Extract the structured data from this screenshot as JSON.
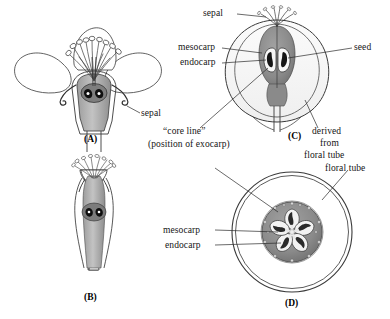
{
  "figure": {
    "panels": [
      {
        "id": "A",
        "label": "(A)",
        "caption": "longitudinal section of flower"
      },
      {
        "id": "B",
        "label": "(B)",
        "caption": "longitudinal section of young fruit"
      },
      {
        "id": "C",
        "label": "(C)",
        "caption": "longitudinal section of mature apple"
      },
      {
        "id": "D",
        "label": "(D)",
        "caption": "transverse section of mature apple"
      }
    ]
  },
  "labels": {
    "sepal_a": "sepal",
    "sepal_c": "sepal",
    "mesocarp_c": "mesocarp",
    "endocarp_c": "endocarp",
    "seed_c": "seed",
    "core_line_1": "“core line”",
    "core_line_2": "(position of exocarp)",
    "derived_1": "derived",
    "derived_2": "from",
    "derived_3": "floral tube",
    "mesocarp_d": "mesocarp",
    "endocarp_d": "endocarp",
    "floral_tube_d": "floral tube"
  },
  "colors": {
    "ink": "#1a1a1a",
    "outline": "#333333",
    "core_gray": "#8a8a8a",
    "core_gray_dark": "#6f6f6f",
    "tissue_gray": "#b5b5b5",
    "tissue_light": "#d9d9d9",
    "seed_dark": "#151515",
    "locule_white": "#f4f4f4",
    "background": "#ffffff"
  }
}
